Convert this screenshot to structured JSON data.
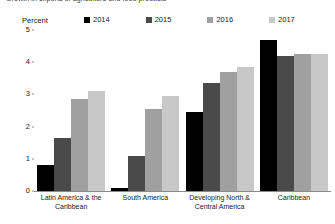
{
  "chart_data": {
    "type": "bar",
    "title": "Growth in exports of agriculture and food products",
    "ylabel": "Percent",
    "xlabel": "",
    "ylim": [
      0,
      5
    ],
    "yticks": [
      0,
      1,
      2,
      3,
      4,
      5
    ],
    "ytick_labels": [
      "0",
      "1",
      "2",
      "3",
      "4",
      "5"
    ],
    "grid": false,
    "legend_position": "top",
    "categories": [
      "Latin America & the Caribbean",
      "South America",
      "Developing North & Central America",
      "Caribbean"
    ],
    "series": [
      {
        "name": "2014",
        "color": "#000000",
        "values": [
          0.8,
          0.1,
          2.45,
          4.7
        ]
      },
      {
        "name": "2015",
        "color": "#4a4a4a",
        "values": [
          1.65,
          1.1,
          3.35,
          4.2
        ]
      },
      {
        "name": "2016",
        "color": "#a0a0a0",
        "values": [
          2.85,
          2.55,
          3.7,
          4.25
        ]
      },
      {
        "name": "2017",
        "color": "#c8c8c8",
        "values": [
          3.1,
          2.95,
          3.85,
          4.25
        ]
      }
    ]
  }
}
